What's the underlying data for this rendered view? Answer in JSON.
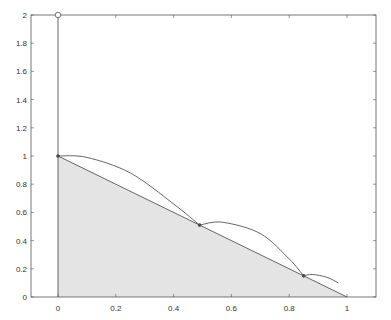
{
  "chart_data": {
    "type": "line",
    "title": "",
    "xlabel": "",
    "ylabel": "",
    "xlim": [
      -0.16,
      1.16
    ],
    "ylim": [
      0,
      2
    ],
    "grid": false,
    "x_ticks": [
      "0",
      "0.2",
      "0.4",
      "0.6",
      "0.8",
      "1"
    ],
    "y_ticks": [
      "0",
      "0.2",
      "0.4",
      "0.6",
      "0.8",
      "1",
      "1.2",
      "1.4",
      "1.6",
      "1.8",
      "2"
    ],
    "shaded_region": {
      "x": [
        0,
        0,
        1
      ],
      "y": [
        0,
        1,
        0
      ],
      "color": "#e4e4e4"
    },
    "series": [
      {
        "name": "diagonal",
        "x": [
          0,
          1
        ],
        "y": [
          1,
          0
        ]
      },
      {
        "name": "vertical line",
        "x": [
          0,
          0
        ],
        "y": [
          0,
          2
        ]
      },
      {
        "name": "marker top",
        "x": [
          0
        ],
        "y": [
          2
        ],
        "marker": "circle"
      },
      {
        "name": "points",
        "x": [
          0,
          0.49,
          0.85
        ],
        "y": [
          1,
          0.51,
          0.15
        ],
        "marker": "dot"
      },
      {
        "name": "arc 1",
        "x": [
          0,
          0.1,
          0.25,
          0.4,
          0.49
        ],
        "y": [
          1,
          0.99,
          0.88,
          0.66,
          0.51
        ]
      },
      {
        "name": "arc 2",
        "x": [
          0.49,
          0.57,
          0.7,
          0.8,
          0.85
        ],
        "y": [
          0.51,
          0.53,
          0.45,
          0.27,
          0.15
        ]
      },
      {
        "name": "arc 3",
        "x": [
          0.85,
          0.88,
          0.93,
          0.97
        ],
        "y": [
          0.15,
          0.16,
          0.14,
          0.1
        ]
      }
    ]
  }
}
